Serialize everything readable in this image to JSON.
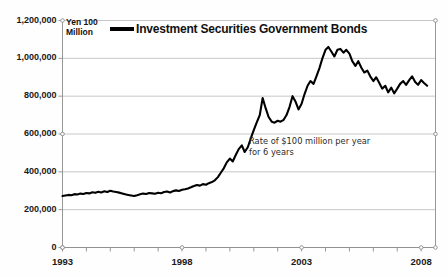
{
  "chart_data": {
    "type": "line",
    "title": "",
    "subtitle": "",
    "unit_label": "Yen 100\nMillion",
    "xlabel": "",
    "ylabel": "",
    "xlim": [
      1993,
      2008.6
    ],
    "ylim": [
      0,
      1200000
    ],
    "grid": true,
    "legend_position": "top",
    "legend": [
      "Investment Securities Government Bonds"
    ],
    "y_ticks": [
      0,
      200000,
      400000,
      600000,
      800000,
      1000000,
      1200000
    ],
    "y_tick_labels": [
      "0",
      "200,000",
      "400,000",
      "600,000",
      "800,000",
      "1,000,000",
      "1,200,000"
    ],
    "x_ticks": [
      1993,
      1998,
      2003,
      2008
    ],
    "x_tick_labels": [
      "1993",
      "1998",
      "2003",
      "2008"
    ],
    "x_minor_tick_interval": 1,
    "annotations": [
      {
        "text": "Rate of $100 million per year\nfor 6 years",
        "x": 2000.6,
        "y": 520000
      }
    ],
    "line_color": "#000000",
    "line_width": 2.1,
    "grid_color": "#b9b9b9",
    "axis_color": "#8c8c8c",
    "background_color": "#ffffff",
    "series": [
      {
        "name": "Investment Securities Government Bonds",
        "x": [
          1993.0,
          1993.12,
          1993.25,
          1993.37,
          1993.5,
          1993.62,
          1993.75,
          1993.87,
          1994.0,
          1994.12,
          1994.25,
          1994.37,
          1994.5,
          1994.62,
          1994.75,
          1994.87,
          1995.0,
          1995.12,
          1995.25,
          1995.37,
          1995.5,
          1995.62,
          1995.75,
          1995.87,
          1996.0,
          1996.12,
          1996.25,
          1996.37,
          1996.5,
          1996.62,
          1996.75,
          1996.87,
          1997.0,
          1997.12,
          1997.25,
          1997.37,
          1997.5,
          1997.62,
          1997.75,
          1997.87,
          1998.0,
          1998.12,
          1998.25,
          1998.37,
          1998.5,
          1998.62,
          1998.75,
          1998.87,
          1999.0,
          1999.12,
          1999.25,
          1999.37,
          1999.5,
          1999.62,
          1999.75,
          1999.87,
          2000.0,
          2000.12,
          2000.25,
          2000.37,
          2000.5,
          2000.62,
          2000.75,
          2000.87,
          2001.0,
          2001.12,
          2001.25,
          2001.37,
          2001.5,
          2001.62,
          2001.75,
          2001.87,
          2002.0,
          2002.12,
          2002.25,
          2002.37,
          2002.5,
          2002.62,
          2002.75,
          2002.87,
          2003.0,
          2003.12,
          2003.25,
          2003.37,
          2003.5,
          2003.62,
          2003.75,
          2003.87,
          2004.0,
          2004.12,
          2004.25,
          2004.37,
          2004.5,
          2004.62,
          2004.75,
          2004.87,
          2005.0,
          2005.12,
          2005.25,
          2005.37,
          2005.5,
          2005.62,
          2005.75,
          2005.87,
          2006.0,
          2006.12,
          2006.25,
          2006.37,
          2006.5,
          2006.62,
          2006.75,
          2006.87,
          2007.0,
          2007.12,
          2007.25,
          2007.37,
          2007.5,
          2007.62,
          2007.75,
          2007.87,
          2008.0,
          2008.12,
          2008.25
        ],
        "values": [
          272000,
          275000,
          278000,
          276000,
          282000,
          280000,
          285000,
          283000,
          288000,
          286000,
          292000,
          289000,
          295000,
          291000,
          297000,
          293000,
          300000,
          296000,
          293000,
          290000,
          286000,
          281000,
          278000,
          275000,
          272000,
          276000,
          281000,
          285000,
          283000,
          288000,
          286000,
          284000,
          289000,
          287000,
          293000,
          296000,
          291000,
          298000,
          302000,
          299000,
          305000,
          308000,
          312000,
          318000,
          325000,
          330000,
          327000,
          335000,
          332000,
          340000,
          346000,
          355000,
          372000,
          395000,
          420000,
          450000,
          470000,
          455000,
          490000,
          520000,
          540000,
          505000,
          530000,
          575000,
          620000,
          660000,
          700000,
          790000,
          735000,
          690000,
          665000,
          660000,
          670000,
          665000,
          675000,
          700000,
          745000,
          800000,
          770000,
          730000,
          760000,
          810000,
          855000,
          880000,
          865000,
          905000,
          950000,
          1000000,
          1045000,
          1060000,
          1035000,
          1010000,
          1045000,
          1050000,
          1030000,
          1045000,
          1025000,
          985000,
          960000,
          985000,
          950000,
          925000,
          935000,
          905000,
          880000,
          900000,
          870000,
          840000,
          855000,
          820000,
          845000,
          815000,
          840000,
          865000,
          880000,
          860000,
          885000,
          905000,
          875000,
          860000,
          885000,
          870000,
          855000
        ]
      }
    ]
  }
}
